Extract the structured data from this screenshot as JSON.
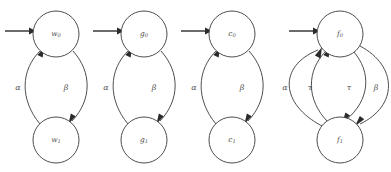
{
  "figure": {
    "title": "",
    "background_color": "#ffffff",
    "stroke_color": "#3a3a3a",
    "label_color": "#555555",
    "width": 391,
    "height": 172
  },
  "diagram_data": {
    "type": "state-machine-diagram",
    "description": "Four two-state automata shown side by side, each with an initial incoming arrow into the upper state.",
    "automata": [
      {
        "id": "w",
        "states": [
          {
            "id": "w0",
            "label": "w",
            "subscript": "0",
            "position": "top",
            "initial": true,
            "cx": 56,
            "cy": 34,
            "r": 23
          },
          {
            "id": "w1",
            "label": "w",
            "subscript": "1",
            "position": "bottom",
            "initial": false,
            "cx": 56,
            "cy": 140,
            "r": 23
          }
        ],
        "transitions": [
          {
            "label": "α",
            "from": "w1",
            "to": "w0",
            "side": "left",
            "label_x": 18,
            "label_y": 88
          },
          {
            "label": "β",
            "from": "w0",
            "to": "w1",
            "side": "right",
            "label_x": 66,
            "label_y": 88
          }
        ]
      },
      {
        "id": "g",
        "states": [
          {
            "id": "g0",
            "label": "g",
            "subscript": "0",
            "position": "top",
            "initial": true,
            "cx": 144,
            "cy": 34,
            "r": 23
          },
          {
            "id": "g1",
            "label": "g",
            "subscript": "1",
            "position": "bottom",
            "initial": false,
            "cx": 144,
            "cy": 140,
            "r": 23
          }
        ],
        "transitions": [
          {
            "label": "α",
            "from": "g1",
            "to": "g0",
            "side": "left",
            "label_x": 106,
            "label_y": 88
          },
          {
            "label": "β",
            "from": "g0",
            "to": "g1",
            "side": "right",
            "label_x": 154,
            "label_y": 88
          }
        ]
      },
      {
        "id": "c",
        "states": [
          {
            "id": "c0",
            "label": "c",
            "subscript": "0",
            "position": "top",
            "initial": true,
            "cx": 232,
            "cy": 34,
            "r": 23
          },
          {
            "id": "c1",
            "label": "c",
            "subscript": "1",
            "position": "bottom",
            "initial": false,
            "cx": 232,
            "cy": 140,
            "r": 23
          }
        ],
        "transitions": [
          {
            "label": "α",
            "from": "c1",
            "to": "c0",
            "side": "left",
            "label_x": 194,
            "label_y": 88
          },
          {
            "label": "β",
            "from": "c0",
            "to": "c1",
            "side": "right",
            "label_x": 242,
            "label_y": 88
          }
        ]
      },
      {
        "id": "f",
        "states": [
          {
            "id": "f0",
            "label": "f",
            "subscript": "0",
            "position": "top",
            "initial": true,
            "cx": 340,
            "cy": 34,
            "r": 23
          },
          {
            "id": "f1",
            "label": "f",
            "subscript": "1",
            "position": "bottom",
            "initial": false,
            "cx": 340,
            "cy": 140,
            "r": 23
          }
        ],
        "transitions": [
          {
            "label": "α",
            "from": "f1",
            "to": "f0",
            "side": "far-left",
            "label_x": 285,
            "label_y": 88
          },
          {
            "label": "τ",
            "from": "f1",
            "to": "f0",
            "side": "inner-left",
            "label_x": 310,
            "label_y": 88
          },
          {
            "label": "τ",
            "from": "f0",
            "to": "f1",
            "side": "inner-right",
            "label_x": 349,
            "label_y": 88
          },
          {
            "label": "β",
            "from": "f0",
            "to": "f1",
            "side": "far-right",
            "label_x": 376,
            "label_y": 88
          }
        ]
      }
    ],
    "initial_arrows": [
      {
        "target": "w0",
        "x1": 5,
        "x2": 32,
        "y": 31
      },
      {
        "target": "g0",
        "x1": 93,
        "x2": 120,
        "y": 31
      },
      {
        "target": "c0",
        "x1": 181,
        "x2": 208,
        "y": 31
      },
      {
        "target": "f0",
        "x1": 289,
        "x2": 316,
        "y": 31
      }
    ]
  }
}
